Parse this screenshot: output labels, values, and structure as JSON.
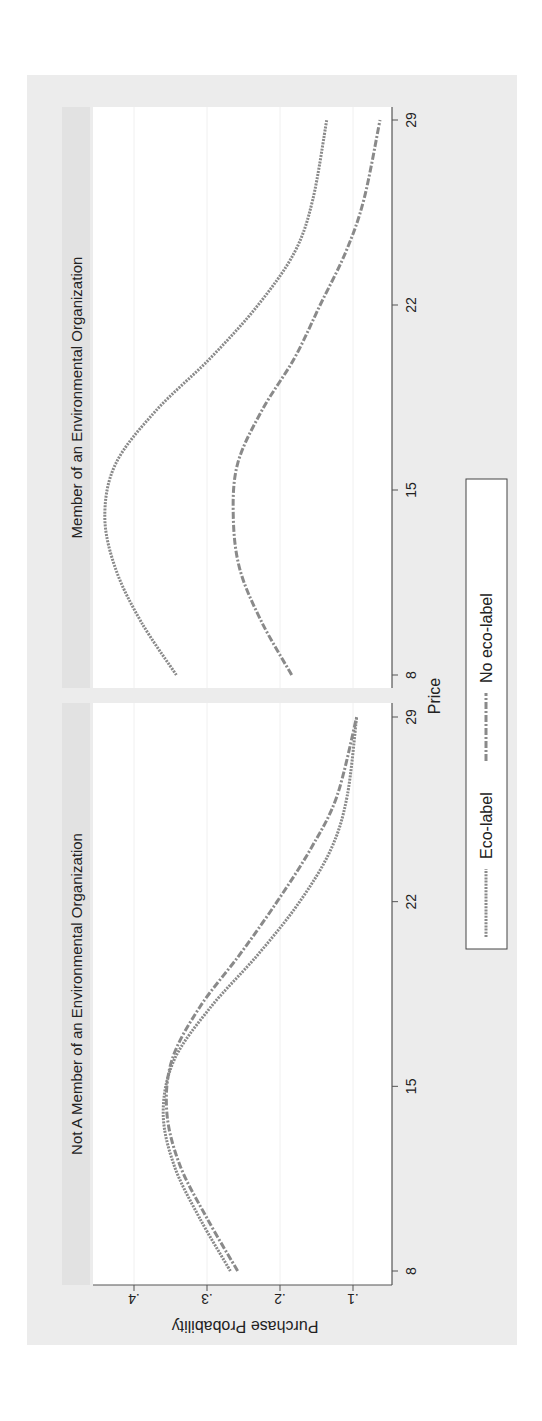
{
  "figure": {
    "rotation_deg": -90,
    "x_axis_title": "Price",
    "y_axis_title": "Purchase Probability",
    "x_ticks": [
      "8",
      "15",
      "22",
      "29"
    ],
    "y_ticks": [
      ".1",
      ".2",
      ".3",
      ".4"
    ],
    "panels": [
      {
        "title": "Not A Member of an Environmental Organization"
      },
      {
        "title": "Member of an Environmental Organization"
      }
    ],
    "legend": {
      "items": [
        {
          "label": "Eco-label",
          "style": "dotted"
        },
        {
          "label": "No eco-label",
          "style": "dash-dot"
        }
      ]
    },
    "colors": {
      "outer_background": "#ececec",
      "panel_title_background": "#e2e2e2",
      "plot_background": "#ffffff",
      "line": "#8a8a8a",
      "axis": "#555555"
    }
  },
  "chart_data": {
    "type": "line",
    "title": "",
    "xlabel": "Price",
    "ylabel": "Purchase Probability",
    "xlim": [
      8,
      29
    ],
    "ylim": [
      0.08,
      0.47
    ],
    "grid": true,
    "legend_position": "bottom",
    "x": [
      8,
      10,
      12,
      14,
      16,
      18,
      20,
      22,
      24,
      26,
      29
    ],
    "panels": [
      {
        "title": "Not A Member of an Environmental Organization",
        "series": [
          {
            "name": "Eco-label",
            "values": [
              0.268,
              0.31,
              0.345,
              0.36,
              0.345,
              0.295,
              0.23,
              0.173,
              0.13,
              0.108,
              0.095
            ]
          },
          {
            "name": "No eco-label",
            "values": [
              0.258,
              0.3,
              0.337,
              0.355,
              0.348,
              0.31,
              0.255,
              0.204,
              0.158,
              0.122,
              0.095
            ]
          }
        ]
      },
      {
        "title": "Member of an Environmental Organization",
        "series": [
          {
            "name": "Eco-label",
            "values": [
              0.342,
              0.39,
              0.425,
              0.44,
              0.425,
              0.37,
              0.295,
              0.23,
              0.18,
              0.155,
              0.136
            ]
          },
          {
            "name": "No eco-label",
            "values": [
              0.184,
              0.225,
              0.255,
              0.264,
              0.258,
              0.225,
              0.18,
              0.145,
              0.11,
              0.085,
              0.063
            ]
          }
        ]
      }
    ]
  }
}
